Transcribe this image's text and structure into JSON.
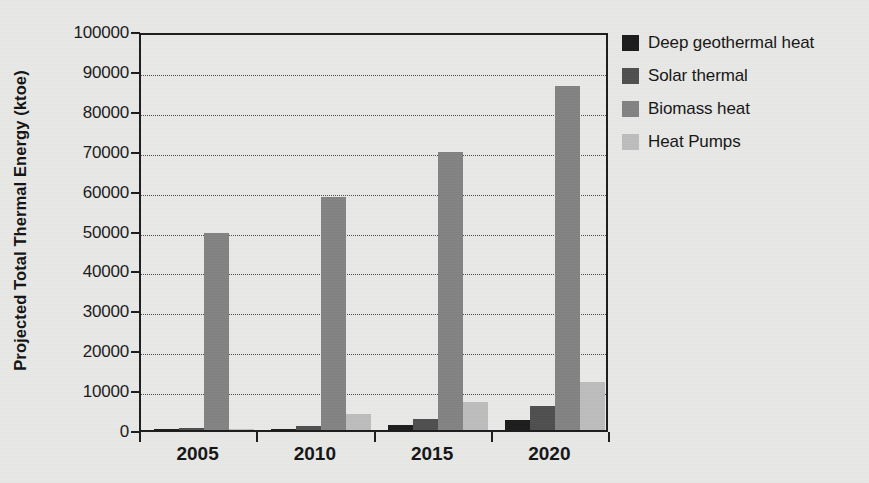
{
  "chart_data": {
    "type": "bar",
    "title": "",
    "subtitle": "",
    "xlabel": "",
    "ylabel": "Projected Total Thermal Energy (ktoe)",
    "categories": [
      "2005",
      "2010",
      "2015",
      "2020"
    ],
    "series": [
      {
        "name": "Deep geothermal heat",
        "color": "#1c1c1c",
        "values": [
          150,
          300,
          1200,
          2500
        ]
      },
      {
        "name": "Solar thermal",
        "color": "#4f4f4f",
        "values": [
          400,
          1100,
          2800,
          6000
        ]
      },
      {
        "name": "Biomass heat",
        "color": "#838383",
        "values": [
          49500,
          58300,
          69600,
          86200
        ]
      },
      {
        "name": "Heat Pumps",
        "color": "#bdbdbd",
        "values": [
          200,
          3900,
          7000,
          12000
        ]
      }
    ],
    "ylim": [
      0,
      100000
    ],
    "yticks": [
      0,
      10000,
      20000,
      30000,
      40000,
      50000,
      60000,
      70000,
      80000,
      90000,
      100000
    ],
    "ytick_labels": [
      "0",
      "10000",
      "20000",
      "30000",
      "40000",
      "50000",
      "60000",
      "70000",
      "80000",
      "90000",
      "100000"
    ],
    "grid": true,
    "grid_style": "dotted-horizontal",
    "legend_position": "right",
    "legend_entries": [
      "Deep geothermal heat",
      "Solar thermal",
      "Biomass heat",
      "Heat Pumps"
    ],
    "annotations": [],
    "background_color": "#e8e8e6",
    "axis_color": "#1d1d1d"
  }
}
